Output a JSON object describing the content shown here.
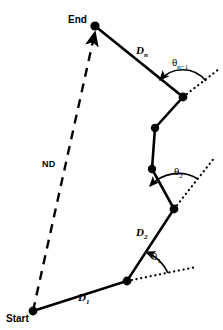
{
  "figure": {
    "type": "diagram",
    "background_color": "#ffffff",
    "stroke_color": "#000000"
  },
  "labels": {
    "start": "Start",
    "end": "End",
    "net_displacement": "ND",
    "d1_base": "D",
    "d1_sub": "1",
    "d2_base": "D",
    "d2_sub": "2",
    "dn_base": "D",
    "dn_sub": "n",
    "theta1_base": "θ",
    "theta1_sub": "1",
    "theta2_base": "θ",
    "theta2_sub": "2",
    "thetan_base": "θ",
    "thetan_sub": "n−1"
  },
  "path": {
    "nodes": [
      {
        "name": "start",
        "x": 33,
        "y": 311
      },
      {
        "name": "v1",
        "x": 127,
        "y": 281
      },
      {
        "name": "v2",
        "x": 174,
        "y": 209
      },
      {
        "name": "v3",
        "x": 152,
        "y": 169
      },
      {
        "name": "v4",
        "x": 155,
        "y": 128
      },
      {
        "name": "v5",
        "x": 183,
        "y": 97
      },
      {
        "name": "end",
        "x": 95,
        "y": 26
      }
    ],
    "segments": [
      {
        "label": "D1",
        "from": "start",
        "to": "v1"
      },
      {
        "label": "D2",
        "from": "v1",
        "to": "v2"
      },
      {
        "label": "",
        "from": "v2",
        "to": "v3"
      },
      {
        "label": "",
        "from": "v3",
        "to": "v4"
      },
      {
        "label": "",
        "from": "v4",
        "to": "v5"
      },
      {
        "label": "Dn",
        "from": "v5",
        "to": "end"
      }
    ],
    "net_displacement_line": {
      "from": "start",
      "to": "end",
      "style": "dashed",
      "arrowhead_at": "end"
    }
  },
  "angles": [
    {
      "name": "theta1",
      "vertex": "v1",
      "style": "dotted-extension"
    },
    {
      "name": "theta2",
      "vertex": "v2",
      "style": "dotted-extension"
    },
    {
      "name": "thetan-1",
      "vertex": "v5",
      "style": "dotted-extension"
    }
  ]
}
